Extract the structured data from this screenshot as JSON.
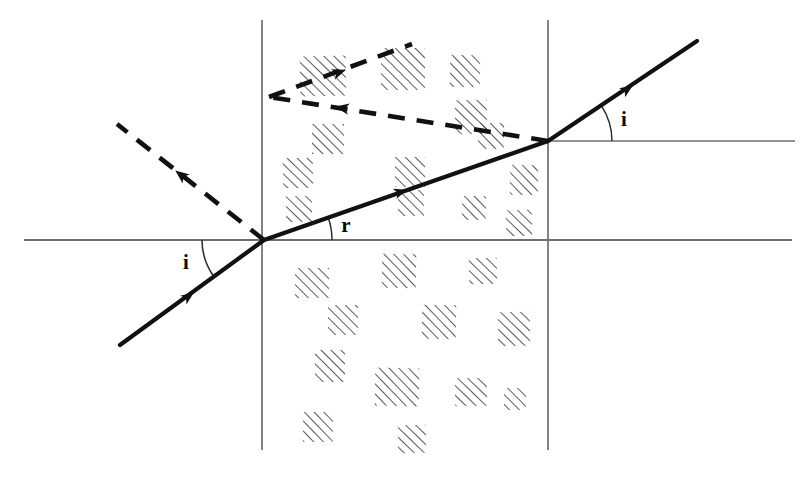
{
  "figure": {
    "background_color": "#ffffff",
    "ink_color": "#111111",
    "boundary_color": "#6e6e6e",
    "width": 801,
    "height": 482
  },
  "labels": {
    "angle_of_incidence_left": "i",
    "angle_of_refraction": "r",
    "angle_of_emergence_right": "i"
  },
  "geometry": {
    "entry_point": {
      "x": 264,
      "y": 240
    },
    "exit_point": {
      "x": 548,
      "y": 141
    },
    "slab_left_face_x": 262,
    "slab_right_face_x": 548,
    "slab_face_top_y": 20,
    "slab_face_bottom_y": 450,
    "normal_lower_y": 240,
    "normal_lower_x_start": 24,
    "normal_lower_x_end": 792,
    "normal_upper_y": 141,
    "normal_upper_x_start": 548,
    "normal_upper_x_end": 795
  },
  "rays": {
    "incident": {
      "name": "incident-ray",
      "style": "solid",
      "start": {
        "x": 120,
        "y": 345
      },
      "end": {
        "x": 264,
        "y": 240
      },
      "arrow_at": {
        "x": 193,
        "y": 293
      }
    },
    "refracted": {
      "name": "refracted-ray",
      "style": "solid",
      "start": {
        "x": 264,
        "y": 240
      },
      "end": {
        "x": 548,
        "y": 141
      },
      "arrow_at": {
        "x": 406,
        "y": 190
      }
    },
    "emergent": {
      "name": "emergent-ray",
      "style": "solid",
      "start": {
        "x": 548,
        "y": 141
      },
      "end": {
        "x": 697,
        "y": 41
      },
      "arrow_at": {
        "x": 632,
        "y": 86
      }
    },
    "reflected_at_entry": {
      "name": "reflected-ray-entry",
      "style": "dashed",
      "start": {
        "x": 264,
        "y": 240
      },
      "end": {
        "x": 117,
        "y": 124
      },
      "arrow_at": {
        "x": 176,
        "y": 171
      }
    },
    "internal_reflection_leg_one": {
      "name": "internal-reflection-leg-1",
      "style": "dashed",
      "start": {
        "x": 548,
        "y": 141
      },
      "end": {
        "x": 269,
        "y": 97
      },
      "arrow_at": {
        "x": 336,
        "y": 107
      }
    },
    "internal_reflection_leg_two": {
      "name": "internal-reflection-leg-2",
      "style": "dashed",
      "start": {
        "x": 269,
        "y": 97
      },
      "end": {
        "x": 412,
        "y": 44
      },
      "arrow_at": {
        "x": 345,
        "y": 70
      }
    }
  },
  "angle_arcs": {
    "incidence_left": {
      "label_x": 186,
      "label_y": 269,
      "radius": 62
    },
    "refraction": {
      "label_x": 346,
      "label_y": 232,
      "radius": 68
    },
    "emergence_right": {
      "label_x": 624,
      "label_y": 126,
      "radius": 64
    }
  },
  "hatch_clusters": [
    {
      "x": 300,
      "y": 56,
      "w": 46,
      "h": 40
    },
    {
      "x": 381,
      "y": 48,
      "w": 44,
      "h": 42
    },
    {
      "x": 450,
      "y": 55,
      "w": 30,
      "h": 32
    },
    {
      "x": 455,
      "y": 100,
      "w": 32,
      "h": 34
    },
    {
      "x": 312,
      "y": 124,
      "w": 32,
      "h": 30
    },
    {
      "x": 478,
      "y": 123,
      "w": 26,
      "h": 26
    },
    {
      "x": 283,
      "y": 158,
      "w": 30,
      "h": 30
    },
    {
      "x": 395,
      "y": 157,
      "w": 30,
      "h": 30
    },
    {
      "x": 510,
      "y": 165,
      "w": 28,
      "h": 30
    },
    {
      "x": 286,
      "y": 196,
      "w": 26,
      "h": 26
    },
    {
      "x": 398,
      "y": 190,
      "w": 26,
      "h": 26
    },
    {
      "x": 462,
      "y": 196,
      "w": 24,
      "h": 24
    },
    {
      "x": 506,
      "y": 210,
      "w": 26,
      "h": 26
    },
    {
      "x": 295,
      "y": 268,
      "w": 34,
      "h": 30
    },
    {
      "x": 382,
      "y": 254,
      "w": 34,
      "h": 34
    },
    {
      "x": 469,
      "y": 258,
      "w": 28,
      "h": 26
    },
    {
      "x": 328,
      "y": 305,
      "w": 30,
      "h": 30
    },
    {
      "x": 422,
      "y": 305,
      "w": 34,
      "h": 34
    },
    {
      "x": 498,
      "y": 312,
      "w": 32,
      "h": 34
    },
    {
      "x": 315,
      "y": 350,
      "w": 30,
      "h": 32
    },
    {
      "x": 375,
      "y": 368,
      "w": 44,
      "h": 38
    },
    {
      "x": 455,
      "y": 378,
      "w": 32,
      "h": 28
    },
    {
      "x": 504,
      "y": 388,
      "w": 22,
      "h": 22
    },
    {
      "x": 303,
      "y": 412,
      "w": 30,
      "h": 30
    },
    {
      "x": 398,
      "y": 425,
      "w": 28,
      "h": 28
    }
  ]
}
